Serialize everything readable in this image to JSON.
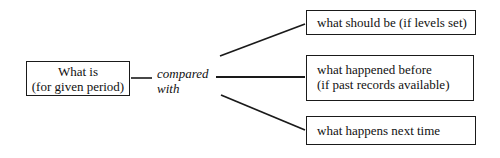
{
  "diagram": {
    "source_box": {
      "lines": [
        "What is",
        "(for given period)"
      ]
    },
    "connector_label": {
      "lines": [
        "compared",
        "with"
      ]
    },
    "targets": [
      {
        "lines": [
          "what should be (if levels set)"
        ]
      },
      {
        "lines": [
          "what happened before",
          "(if past records available)"
        ]
      },
      {
        "lines": [
          "what happens next time"
        ]
      }
    ],
    "colors": {
      "stroke": "#1a1a1a",
      "background": "#ffffff",
      "text": "#111111"
    }
  }
}
